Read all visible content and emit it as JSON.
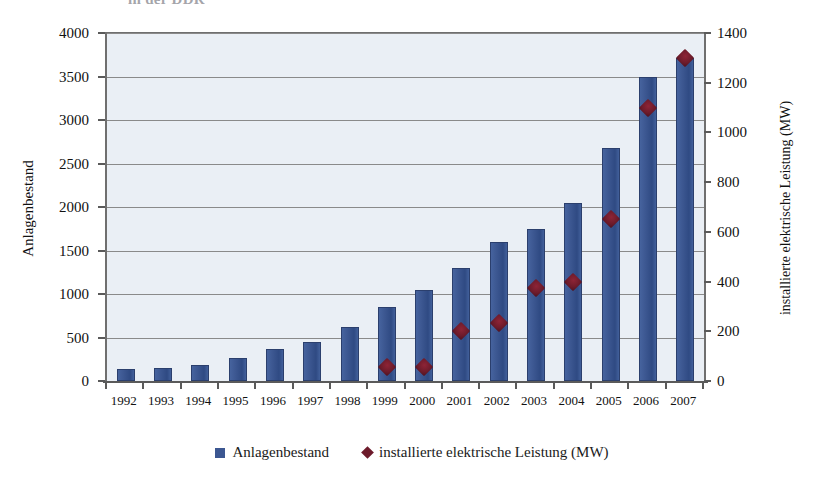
{
  "title_fragment": "in der DDR",
  "chart_data": {
    "type": "bar",
    "title": "",
    "xlabel": "",
    "ylabel": "Anlagenbestand",
    "y2label": "installierte elektrische Leistung (MW)",
    "ylim": [
      0,
      4000
    ],
    "y2lim": [
      0,
      1400
    ],
    "y_ticks": [
      "0",
      "500",
      "1000",
      "1500",
      "2000",
      "2500",
      "3000",
      "3500",
      "4000"
    ],
    "y2_ticks": [
      "0",
      "200",
      "400",
      "600",
      "800",
      "1000",
      "1200",
      "1400"
    ],
    "grid": true,
    "legend_position": "bottom",
    "categories": [
      "1992",
      "1993",
      "1994",
      "1995",
      "1996",
      "1997",
      "1998",
      "1999",
      "2000",
      "2001",
      "2002",
      "2003",
      "2004",
      "2005",
      "2006",
      "2007"
    ],
    "series": [
      {
        "name": "Anlagenbestand",
        "type": "bar",
        "axis": "left",
        "color": "#3c5791",
        "values": [
          140,
          155,
          180,
          270,
          370,
          450,
          620,
          850,
          1050,
          1300,
          1600,
          1750,
          2050,
          2680,
          3490,
          3710
        ]
      },
      {
        "name": "installierte elektrische Leistung (MW)",
        "type": "scatter",
        "axis": "right",
        "color": "#6d1b2b",
        "marker": "diamond",
        "values": [
          null,
          null,
          null,
          null,
          null,
          null,
          null,
          55,
          55,
          200,
          235,
          375,
          400,
          650,
          1100,
          1300
        ]
      }
    ]
  },
  "legend": {
    "items": [
      {
        "label": "Anlagenbestand",
        "marker": "square",
        "color": "#3c5791"
      },
      {
        "label": "installierte elektrische Leistung (MW)",
        "marker": "diamond",
        "color": "#6d1b2b"
      }
    ]
  }
}
